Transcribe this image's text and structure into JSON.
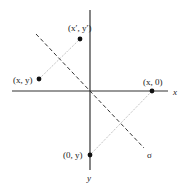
{
  "diagram": {
    "axes": {
      "x_label": "x",
      "y_label": "y"
    },
    "line": {
      "label": "σ",
      "style": "dashed"
    },
    "points": [
      {
        "id": "p-xy",
        "label": "(x, y)"
      },
      {
        "id": "p-xpyp",
        "label": "(x′, y′)"
      },
      {
        "id": "p-x0",
        "label": "(x, 0)"
      },
      {
        "id": "p-0y",
        "label": "(0, y)"
      }
    ],
    "connectors": [
      {
        "from": "(x, y)",
        "to": "(x′, y′)",
        "style": "dotted"
      },
      {
        "from": "(x, 0)",
        "to": "(0, y)",
        "style": "dotted"
      }
    ]
  }
}
